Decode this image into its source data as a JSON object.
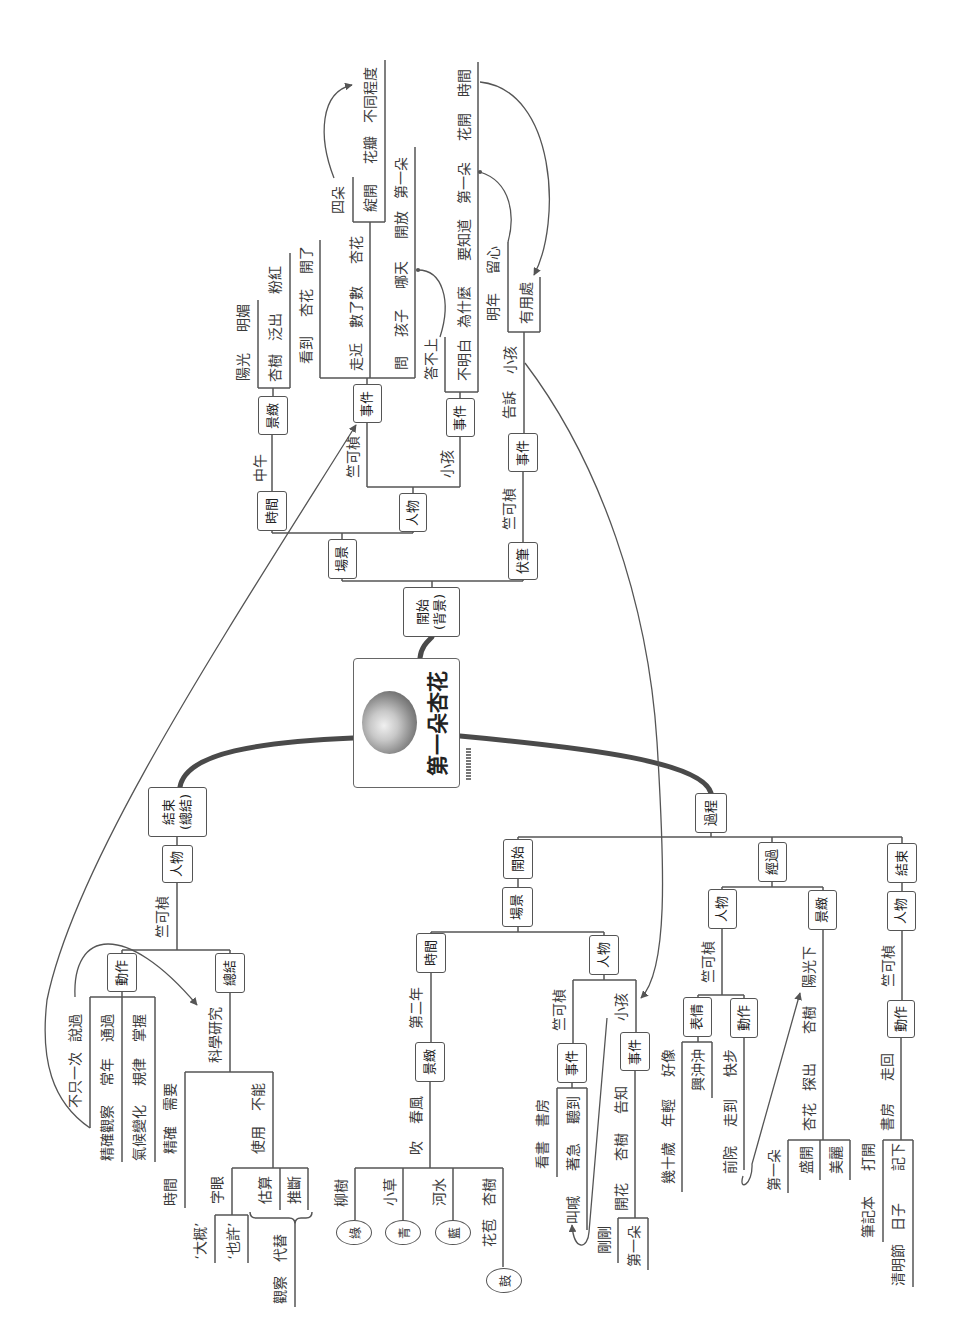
{
  "mindmap": {
    "central_topic": "第一朵杏花",
    "beginning": {
      "label": "開始",
      "sublabel": "(背景)",
      "scene": {
        "label": "場景",
        "time": {
          "label": "時間",
          "value": "中午"
        },
        "scenery": {
          "label": "景緻",
          "phrase1": [
            "陽光",
            "明媚"
          ],
          "phrase2": [
            "杏樹",
            "泛出",
            "粉紅"
          ]
        },
        "people": {
          "label": "人物",
          "zhu": {
            "name": "竺可楨",
            "event": "事件",
            "phrase1": [
              "看到",
              "杏花",
              "開了"
            ],
            "phrase2": [
              "走近",
              "數了數",
              "杏花"
            ],
            "phrase2_count": "四朵",
            "phrase2_detail": [
              "綻開",
              "花瓣",
              "不同程度"
            ],
            "phrase3": [
              "問",
              "孩子",
              "哪天",
              "開放",
              "第一朵"
            ]
          },
          "child": {
            "name": "小孩",
            "event": "事件",
            "phrase1": [
              "答不上"
            ],
            "phrase2": [
              "不明白",
              "為什麼",
              "要知道",
              "第一朵",
              "花開",
              "時間"
            ]
          }
        }
      },
      "foreshadow": {
        "label": "伏筆",
        "name": "竺可楨",
        "event": "事件",
        "phrase": [
          "告訴",
          "小孩"
        ],
        "phrase1": [
          "明年",
          "留心"
        ],
        "phrase2": [
          "有用處"
        ]
      }
    },
    "process": {
      "label": "過程",
      "start": {
        "label": "開始",
        "scene": {
          "label": "場景",
          "time": {
            "label": "時間",
            "value": "第二年"
          },
          "scenery": {
            "label": "景緻",
            "phrase": [
              "春風",
              "吹"
            ],
            "items": [
              {
                "subject": [
                  "柳樹"
                ],
                "color": "綠"
              },
              {
                "subject": [
                  "小草"
                ],
                "color": "青"
              },
              {
                "subject": [
                  "河水"
                ],
                "color": "藍"
              },
              {
                "subject": [
                  "杏樹",
                  "花苞"
                ],
                "color": "鼓"
              }
            ]
          },
          "people": {
            "label": "人物",
            "zhu": {
              "name": "竺可楨",
              "event": "事件",
              "phrase1": [
                "書房",
                "看書"
              ],
              "phrase2": [
                "聽到",
                "著急",
                "叫喊"
              ]
            },
            "child": {
              "name": "小孩",
              "event": "事件",
              "phrase": [
                "告知",
                "杏樹",
                "開花"
              ],
              "detail1": "剛剛",
              "detail2": "第一朵"
            }
          }
        }
      },
      "middle": {
        "label": "經過",
        "people": {
          "label": "人物",
          "name": "竺可楨",
          "expression": {
            "label": "表情",
            "phrase1": [
              "好像",
              "年輕",
              "幾十歲"
            ],
            "phrase2": [
              "興沖沖"
            ]
          },
          "action": {
            "label": "動作",
            "phrase": [
              "快步",
              "走到",
              "前院"
            ]
          }
        },
        "scenery": {
          "label": "景緻",
          "phrase": [
            "陽光下",
            "杏樹",
            "探出",
            "杏花"
          ],
          "details": [
            "第一朵",
            "盛開",
            "美麗"
          ]
        }
      },
      "end": {
        "label": "結束",
        "people": {
          "label": "人物",
          "name": "竺可楨"
        },
        "action": {
          "label": "動作",
          "phrase": [
            "走回",
            "書房"
          ],
          "phrase1": [
            "打開",
            "筆記本"
          ],
          "phrase2": [
            "記下",
            "日子",
            "清明節"
          ]
        }
      }
    },
    "ending": {
      "label": "結束",
      "sublabel": "(總結)",
      "people": {
        "label": "人物",
        "name": "竺可楨"
      },
      "action": {
        "label": "動作",
        "phrase1": [
          "說過",
          "不只一次"
        ],
        "phrase2": [
          "通過",
          "常年",
          "精確觀察"
        ],
        "phrase3": [
          "掌握",
          "規律",
          "氣候變化"
        ]
      },
      "summary": {
        "label": "總結",
        "topic": "科學研究",
        "phrase1": [
          "需要",
          "精確",
          "時間"
        ],
        "phrase2": [
          "不能",
          "使用"
        ],
        "words_label": "字眼",
        "words": [
          "‘大概’",
          "‘也許’"
        ],
        "methods": [
          "估算",
          "推斷"
        ],
        "replace": [
          "代替",
          "觀察"
        ]
      }
    }
  },
  "colors": {
    "background": "#ffffff",
    "line": "#555555",
    "main_branch": "#4a4a4a",
    "box_border": "#555555",
    "text": "#3a3a3a"
  }
}
